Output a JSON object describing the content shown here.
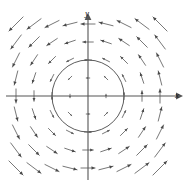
{
  "figure": {
    "title": "",
    "axes": {
      "x_label": "x",
      "y_label": "y"
    },
    "colors": {
      "axis": "#555555",
      "arrow": "#4a4a4a",
      "circle": "#4a4a4a",
      "background": "#ffffff",
      "label": "#1a1a1a"
    },
    "origin": {
      "x": 88,
      "y": 96
    },
    "circle": {
      "cx": 88,
      "cy": 96,
      "r": 36,
      "stroke_width": 0.9
    },
    "x_axis": {
      "x1": 6,
      "y1": 96,
      "x2": 178,
      "y2": 96,
      "arrow_end": "right"
    },
    "y_axis": {
      "x1": 88,
      "y1": 14,
      "x2": 88,
      "y2": 180,
      "arrow_end": "top"
    }
  },
  "chart_data": {
    "type": "scatter",
    "subtype": "vector-field",
    "title": "",
    "xlabel": "x",
    "ylabel": "y",
    "grid": false,
    "legend": null,
    "xlim": [
      -4.5,
      4.5
    ],
    "ylim": [
      -4.5,
      4.5
    ],
    "field": {
      "formula_u": "-y",
      "formula_v": "x",
      "rotation": "counterclockwise",
      "magnitude_scales_with_radius": true
    },
    "annotations": [
      {
        "kind": "circle",
        "cx": 0,
        "cy": 0,
        "r": 2
      }
    ],
    "samples": [
      {
        "x": -4,
        "y": 4,
        "u": -4,
        "v": -4
      },
      {
        "x": -3,
        "y": 4,
        "u": -4,
        "v": -3
      },
      {
        "x": -2,
        "y": 4,
        "u": -4,
        "v": -2
      },
      {
        "x": -1,
        "y": 4,
        "u": -4,
        "v": -1
      },
      {
        "x": 0,
        "y": 4,
        "u": -4,
        "v": 0
      },
      {
        "x": 1,
        "y": 4,
        "u": -4,
        "v": 1
      },
      {
        "x": 2,
        "y": 4,
        "u": -4,
        "v": 2
      },
      {
        "x": 3,
        "y": 4,
        "u": -4,
        "v": 3
      },
      {
        "x": 4,
        "y": 4,
        "u": -4,
        "v": 4
      },
      {
        "x": -4,
        "y": 3,
        "u": -3,
        "v": -4
      },
      {
        "x": -3,
        "y": 3,
        "u": -3,
        "v": -3
      },
      {
        "x": -2,
        "y": 3,
        "u": -3,
        "v": -2
      },
      {
        "x": -1,
        "y": 3,
        "u": -3,
        "v": -1
      },
      {
        "x": 0,
        "y": 3,
        "u": -3,
        "v": 0
      },
      {
        "x": 1,
        "y": 3,
        "u": -3,
        "v": 1
      },
      {
        "x": 2,
        "y": 3,
        "u": -3,
        "v": 2
      },
      {
        "x": 3,
        "y": 3,
        "u": -3,
        "v": 3
      },
      {
        "x": 4,
        "y": 3,
        "u": -3,
        "v": 4
      },
      {
        "x": -4,
        "y": 2,
        "u": -2,
        "v": -4
      },
      {
        "x": -3,
        "y": 2,
        "u": -2,
        "v": -3
      },
      {
        "x": -2,
        "y": 2,
        "u": -2,
        "v": -2
      },
      {
        "x": -1,
        "y": 2,
        "u": -2,
        "v": -1
      },
      {
        "x": 0,
        "y": 2,
        "u": -2,
        "v": 0
      },
      {
        "x": 1,
        "y": 2,
        "u": -2,
        "v": 1
      },
      {
        "x": 2,
        "y": 2,
        "u": -2,
        "v": 2
      },
      {
        "x": 3,
        "y": 2,
        "u": -2,
        "v": 3
      },
      {
        "x": 4,
        "y": 2,
        "u": -2,
        "v": 4
      },
      {
        "x": -4,
        "y": 1,
        "u": -1,
        "v": -4
      },
      {
        "x": -3,
        "y": 1,
        "u": -1,
        "v": -3
      },
      {
        "x": -2,
        "y": 1,
        "u": -1,
        "v": -2
      },
      {
        "x": -1,
        "y": 1,
        "u": -1,
        "v": -1
      },
      {
        "x": 0,
        "y": 1,
        "u": -1,
        "v": 0
      },
      {
        "x": 1,
        "y": 1,
        "u": -1,
        "v": 1
      },
      {
        "x": 2,
        "y": 1,
        "u": -1,
        "v": 2
      },
      {
        "x": 3,
        "y": 1,
        "u": -1,
        "v": 3
      },
      {
        "x": 4,
        "y": 1,
        "u": -1,
        "v": 4
      },
      {
        "x": -4,
        "y": 0,
        "u": 0,
        "v": -4
      },
      {
        "x": -3,
        "y": 0,
        "u": 0,
        "v": -3
      },
      {
        "x": -2,
        "y": 0,
        "u": 0,
        "v": -2
      },
      {
        "x": -1,
        "y": 0,
        "u": 0,
        "v": -1
      },
      {
        "x": 1,
        "y": 0,
        "u": 0,
        "v": 1
      },
      {
        "x": 2,
        "y": 0,
        "u": 0,
        "v": 2
      },
      {
        "x": 3,
        "y": 0,
        "u": 0,
        "v": 3
      },
      {
        "x": 4,
        "y": 0,
        "u": 0,
        "v": 4
      },
      {
        "x": -4,
        "y": -1,
        "u": 1,
        "v": -4
      },
      {
        "x": -3,
        "y": -1,
        "u": 1,
        "v": -3
      },
      {
        "x": -2,
        "y": -1,
        "u": 1,
        "v": -2
      },
      {
        "x": -1,
        "y": -1,
        "u": 1,
        "v": -1
      },
      {
        "x": 0,
        "y": -1,
        "u": 1,
        "v": 0
      },
      {
        "x": 1,
        "y": -1,
        "u": 1,
        "v": 1
      },
      {
        "x": 2,
        "y": -1,
        "u": 1,
        "v": 2
      },
      {
        "x": 3,
        "y": -1,
        "u": 1,
        "v": 3
      },
      {
        "x": 4,
        "y": -1,
        "u": 1,
        "v": 4
      },
      {
        "x": -4,
        "y": -2,
        "u": 2,
        "v": -4
      },
      {
        "x": -3,
        "y": -2,
        "u": 2,
        "v": -3
      },
      {
        "x": -2,
        "y": -2,
        "u": 2,
        "v": -2
      },
      {
        "x": -1,
        "y": -2,
        "u": 2,
        "v": -1
      },
      {
        "x": 0,
        "y": -2,
        "u": 2,
        "v": 0
      },
      {
        "x": 1,
        "y": -2,
        "u": 2,
        "v": 1
      },
      {
        "x": 2,
        "y": -2,
        "u": 2,
        "v": 2
      },
      {
        "x": 3,
        "y": -2,
        "u": 2,
        "v": 3
      },
      {
        "x": 4,
        "y": -2,
        "u": 2,
        "v": 4
      },
      {
        "x": -4,
        "y": -3,
        "u": 3,
        "v": -4
      },
      {
        "x": -3,
        "y": -3,
        "u": 3,
        "v": -3
      },
      {
        "x": -2,
        "y": -3,
        "u": 3,
        "v": -2
      },
      {
        "x": -1,
        "y": -3,
        "u": 3,
        "v": -1
      },
      {
        "x": 0,
        "y": -3,
        "u": 3,
        "v": 0
      },
      {
        "x": 1,
        "y": -3,
        "u": 3,
        "v": 1
      },
      {
        "x": 2,
        "y": -3,
        "u": 3,
        "v": 2
      },
      {
        "x": 3,
        "y": -3,
        "u": 3,
        "v": 3
      },
      {
        "x": 4,
        "y": -3,
        "u": 3,
        "v": 4
      },
      {
        "x": -4,
        "y": -4,
        "u": 4,
        "v": -4
      },
      {
        "x": -3,
        "y": -4,
        "u": 4,
        "v": -3
      },
      {
        "x": -2,
        "y": -4,
        "u": 4,
        "v": -2
      },
      {
        "x": -1,
        "y": -4,
        "u": 4,
        "v": -1
      },
      {
        "x": 0,
        "y": -4,
        "u": 4,
        "v": 0
      },
      {
        "x": 1,
        "y": -4,
        "u": 4,
        "v": 1
      },
      {
        "x": 2,
        "y": -4,
        "u": 4,
        "v": 2
      },
      {
        "x": 3,
        "y": -4,
        "u": 4,
        "v": 3
      },
      {
        "x": 4,
        "y": -4,
        "u": 4,
        "v": 4
      }
    ]
  }
}
